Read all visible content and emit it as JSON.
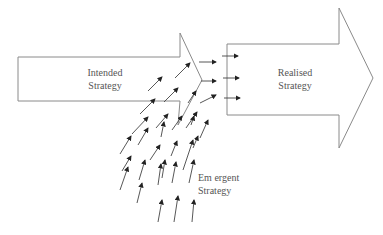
{
  "diagram": {
    "intended": {
      "line1": "Intended",
      "line2": "Strategy"
    },
    "realised": {
      "line1": "Realised",
      "line2": "Strategy"
    },
    "emergent": {
      "line1": "Em ergent",
      "line2": "Strategy"
    }
  },
  "colors": {
    "outline": "#8a8a8a",
    "arrow": "#222222",
    "text": "#555555"
  },
  "emergent_arrows": [
    [
      148,
      91,
      162,
      77
    ],
    [
      175,
      78,
      190,
      63
    ],
    [
      140,
      114,
      155,
      99
    ],
    [
      164,
      102,
      178,
      88
    ],
    [
      188,
      103,
      196,
      91
    ],
    [
      132,
      134,
      148,
      117
    ],
    [
      156,
      128,
      168,
      114
    ],
    [
      172,
      130,
      182,
      116
    ],
    [
      186,
      128,
      197,
      112
    ],
    [
      120,
      154,
      131,
      136
    ],
    [
      138,
      145,
      148,
      128
    ],
    [
      161,
      137,
      164,
      122
    ],
    [
      191,
      125,
      194,
      116
    ],
    [
      122,
      171,
      131,
      156
    ],
    [
      150,
      160,
      160,
      145
    ],
    [
      171,
      156,
      177,
      141
    ],
    [
      193,
      148,
      198,
      136
    ],
    [
      200,
      138,
      208,
      120
    ],
    [
      120,
      190,
      128,
      167
    ],
    [
      139,
      180,
      145,
      160
    ],
    [
      162,
      178,
      165,
      160
    ],
    [
      183,
      170,
      193,
      140
    ],
    [
      137,
      203,
      142,
      183
    ],
    [
      158,
      185,
      161,
      164
    ],
    [
      172,
      183,
      176,
      162
    ],
    [
      189,
      183,
      194,
      160
    ],
    [
      158,
      222,
      162,
      200
    ],
    [
      174,
      222,
      178,
      196
    ],
    [
      192,
      222,
      194,
      200
    ]
  ],
  "realised_arrows": [
    [
      199,
      62,
      216,
      62
    ],
    [
      222,
      56,
      238,
      56
    ],
    [
      201,
      81,
      216,
      81
    ],
    [
      223,
      78,
      239,
      78
    ],
    [
      200,
      103,
      216,
      95
    ],
    [
      224,
      98,
      240,
      98
    ]
  ]
}
